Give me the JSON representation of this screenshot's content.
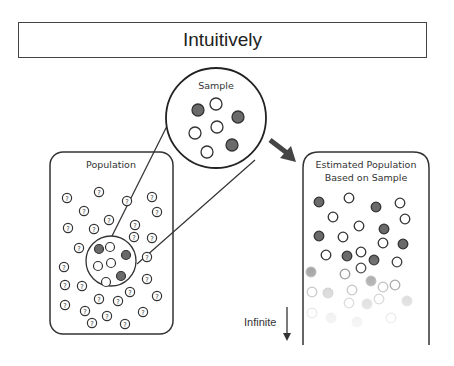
{
  "title": "Intuitively",
  "sample": {
    "label": "Sample"
  },
  "population": {
    "label": "Population",
    "unknown_glyph": "?"
  },
  "estimated": {
    "line1": "Estimated Population",
    "line2": "Based on Sample"
  },
  "infinite_label": "Infinite",
  "colors": {
    "dark_dot": "#6a6a6a",
    "outline": "#333333"
  }
}
